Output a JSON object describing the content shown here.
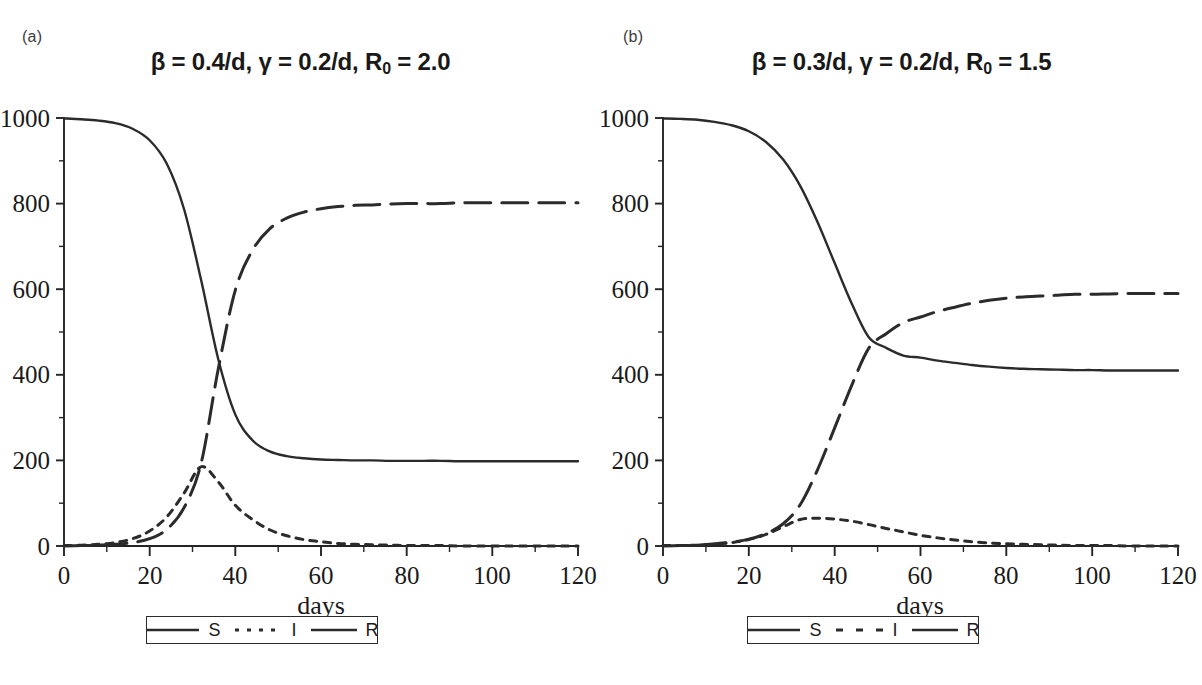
{
  "figure": {
    "background": "#ffffff",
    "ink_color": "#2b2b2b"
  },
  "panels": [
    {
      "tag": "(a)",
      "title_prefix": "β = 0.4/d, γ = 0.2/d, R",
      "title_sub": "0",
      "title_suffix": " = 2.0",
      "title_plain": "β = 0.4/d, γ = 0.2/d, R₀ = 2.0",
      "xlabel": "days",
      "legend": [
        {
          "label": "S",
          "style": "solid"
        },
        {
          "label": "I",
          "style": "dotted"
        },
        {
          "label": "R",
          "style": "solid"
        }
      ]
    },
    {
      "tag": "(b)",
      "title_prefix": "β = 0.3/d, γ = 0.2/d, R",
      "title_sub": "0",
      "title_suffix": " = 1.5",
      "title_plain": "β = 0.3/d, γ = 0.2/d, R₀ = 1.5",
      "xlabel": "days",
      "legend": [
        {
          "label": "S",
          "style": "solid"
        },
        {
          "label": "I",
          "style": "dashed"
        },
        {
          "label": "R",
          "style": "solid"
        }
      ]
    }
  ],
  "chart_data": [
    {
      "type": "line",
      "panel": "(a)",
      "title": "β = 0.4/d, γ = 0.2/d, R₀ = 2.0",
      "xlabel": "days",
      "ylabel": "",
      "xlim": [
        0,
        120
      ],
      "ylim": [
        0,
        1000
      ],
      "xticks": [
        0,
        20,
        40,
        60,
        80,
        100,
        120
      ],
      "yticks": [
        0,
        200,
        400,
        600,
        800,
        1000
      ],
      "xminor_step": 10,
      "yminor_step": 100,
      "grid": false,
      "legend_position": "below-axes",
      "x": [
        0,
        4,
        8,
        12,
        16,
        20,
        24,
        28,
        32,
        36,
        40,
        44,
        48,
        52,
        56,
        60,
        64,
        68,
        72,
        76,
        80,
        84,
        88,
        92,
        96,
        100,
        104,
        108,
        112,
        116,
        120
      ],
      "series": [
        {
          "name": "S",
          "style": "solid",
          "values": [
            999,
            997,
            994,
            988,
            975,
            948,
            893,
            788,
            622,
            437,
            307,
            247,
            221,
            210,
            205,
            202,
            201,
            200,
            200,
            199,
            199,
            199,
            199,
            198,
            198,
            198,
            198,
            198,
            198,
            198,
            198
          ]
        },
        {
          "name": "I",
          "style": "dotted",
          "values": [
            1,
            2,
            4,
            8,
            17,
            35,
            68,
            123,
            185,
            150,
            95,
            62,
            38,
            24,
            15,
            10,
            6,
            4,
            3,
            2,
            1,
            1,
            1,
            0,
            0,
            0,
            0,
            0,
            0,
            0,
            0
          ]
        },
        {
          "name": "R",
          "style": "dashed",
          "values": [
            0,
            1,
            2,
            4,
            8,
            17,
            39,
            89,
            193,
            413,
            598,
            691,
            741,
            766,
            780,
            788,
            793,
            796,
            797,
            799,
            800,
            800,
            800,
            802,
            802,
            802,
            802,
            802,
            802,
            802,
            802
          ]
        }
      ],
      "annotations": {
        "crossing_SR_day": 36,
        "crossing_SR_value": 430,
        "I_peak_day": 33,
        "I_peak_value": 150,
        "S_final": 198,
        "R_final": 802
      }
    },
    {
      "type": "line",
      "panel": "(b)",
      "title": "β = 0.3/d, γ = 0.2/d, R₀ = 1.5",
      "xlabel": "days",
      "ylabel": "",
      "xlim": [
        0,
        120
      ],
      "ylim": [
        0,
        1000
      ],
      "xticks": [
        0,
        20,
        40,
        60,
        80,
        100,
        120
      ],
      "yticks": [
        0,
        200,
        400,
        600,
        800,
        1000
      ],
      "xminor_step": 10,
      "yminor_step": 100,
      "grid": false,
      "legend_position": "below-axes",
      "x": [
        0,
        4,
        8,
        12,
        16,
        20,
        24,
        28,
        32,
        36,
        40,
        44,
        48,
        52,
        56,
        60,
        64,
        68,
        72,
        76,
        80,
        84,
        88,
        92,
        96,
        100,
        104,
        108,
        112,
        116,
        120
      ],
      "series": [
        {
          "name": "S",
          "style": "solid",
          "values": [
            999,
            998,
            996,
            991,
            983,
            969,
            944,
            903,
            841,
            757,
            661,
            566,
            487,
            463,
            445,
            440,
            433,
            428,
            423,
            419,
            416,
            414,
            413,
            412,
            411,
            411,
            410,
            410,
            410,
            410,
            410
          ]
        },
        {
          "name": "I",
          "style": "dashed",
          "values": [
            1,
            1,
            2,
            4,
            8,
            15,
            27,
            45,
            62,
            65,
            63,
            58,
            50,
            41,
            33,
            25,
            19,
            14,
            10,
            7,
            5,
            4,
            3,
            2,
            1,
            1,
            1,
            0,
            0,
            0,
            0
          ]
        },
        {
          "name": "R",
          "style": "dashed",
          "values": [
            0,
            1,
            2,
            5,
            9,
            16,
            29,
            52,
            97,
            178,
            276,
            376,
            463,
            496,
            522,
            535,
            548,
            558,
            567,
            574,
            579,
            582,
            584,
            586,
            588,
            588,
            589,
            590,
            590,
            590,
            590
          ]
        }
      ],
      "annotations": {
        "crossing_SR_day": 78,
        "crossing_SR_value": 480,
        "I_peak_day": 57,
        "I_peak_value": 65,
        "S_final": 410,
        "R_final": 590
      }
    }
  ]
}
